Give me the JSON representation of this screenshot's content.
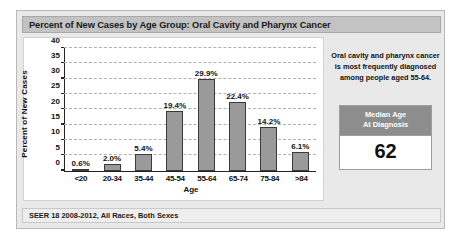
{
  "header": {
    "title": "Percent of New Cases by Age Group: Oral Cavity and Pharynx Cancer"
  },
  "footer": {
    "source": "SEER 18 2008-2012, All Races, Both Sexes"
  },
  "info_panel": {
    "callout": "Oral cavity and pharynx cancer is most frequently diagnosed among people aged 55-64.",
    "median_box": {
      "head_line1": "Median Age",
      "head_line2": "At Diagnosis",
      "value": "62"
    }
  },
  "colors": {
    "bar_fill": "#9a9a9a",
    "bar_border": "#3a3a3a",
    "title_bar": "#c3c3c3",
    "panel_bg": "#e9e9e9",
    "median_head": "#8d8d8d",
    "gridline": "#b0b0b0"
  },
  "chart_data": {
    "type": "bar",
    "title": "Percent of New Cases by Age Group: Oral Cavity and Pharynx Cancer",
    "xlabel": "Age",
    "ylabel": "Percent of New Cases",
    "categories": [
      "<20",
      "20-34",
      "35-44",
      "45-54",
      "55-64",
      "65-74",
      "75-84",
      ">84"
    ],
    "values": [
      0.6,
      2.0,
      5.4,
      19.4,
      29.9,
      22.4,
      14.2,
      6.1
    ],
    "data_labels": [
      "0.6%",
      "2.0%",
      "5.4%",
      "19.4%",
      "29.9%",
      "22.4%",
      "14.2%",
      "6.1%"
    ],
    "ylim": [
      0,
      40
    ],
    "yticks": [
      0,
      5,
      10,
      15,
      20,
      25,
      30,
      35,
      40
    ],
    "ytick_labels": [
      "0",
      "5",
      "10",
      "15",
      "20",
      "25",
      "30",
      "35",
      "40"
    ],
    "grid": true,
    "grid_style": "dashed-horizontal",
    "legend": null
  }
}
